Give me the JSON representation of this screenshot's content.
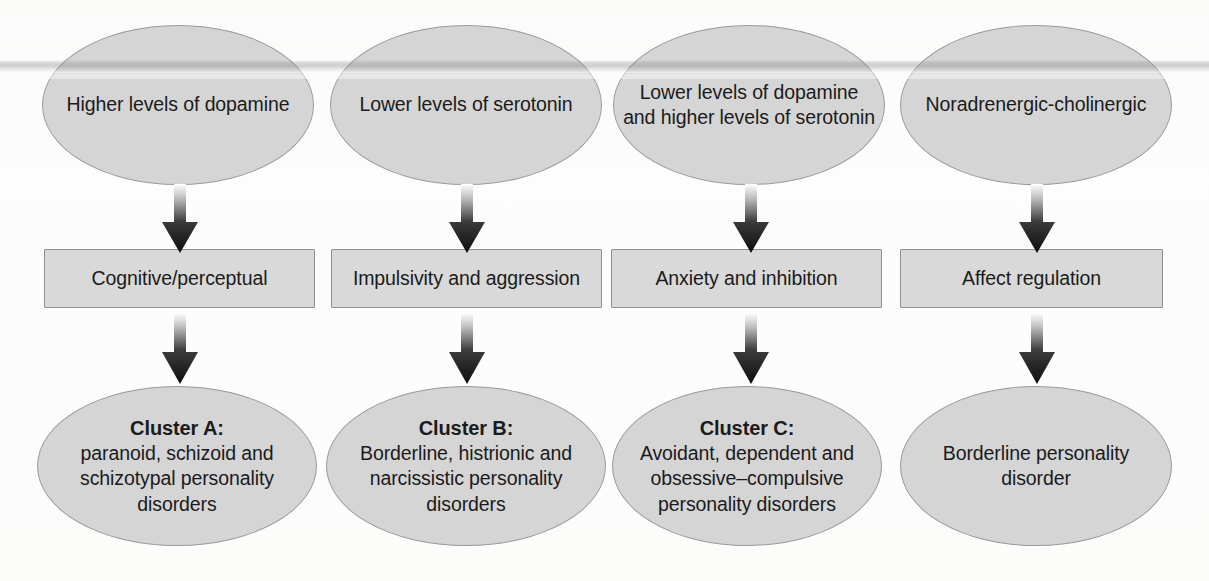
{
  "diagram": {
    "background_color": "#fdfdfd",
    "shape_fill_color": "#d5d5d5",
    "shape_border_color": "#9a9a9a",
    "text_color": "#1b1b1b",
    "arrow_gradient": [
      "#ffffff",
      "#111111"
    ],
    "columns": [
      {
        "id": "column-a",
        "top": {
          "shape": "ellipse",
          "lines": [
            "Higher levels of",
            "dopamine"
          ],
          "text": "Higher levels of dopamine"
        },
        "middle": {
          "shape": "rectangle",
          "text": "Cognitive/perceptual"
        },
        "bottom": {
          "shape": "ellipse",
          "title": "Cluster A:",
          "lines": [
            "paranoid, schizoid",
            "and schizotypal",
            "personality disorders"
          ],
          "text": "paranoid, schizoid and schizotypal personality disorders"
        }
      },
      {
        "id": "column-b",
        "top": {
          "shape": "ellipse",
          "lines": [
            "Lower levels of",
            "serotonin"
          ],
          "text": "Lower levels of serotonin"
        },
        "middle": {
          "shape": "rectangle",
          "text": "Impulsivity and aggression"
        },
        "bottom": {
          "shape": "ellipse",
          "title": "Cluster B:",
          "lines": [
            "Borderline, histrionic",
            "and narcissistic",
            "personality disorders"
          ],
          "text": "Borderline, histrionic and narcissistic personality disorders"
        }
      },
      {
        "id": "column-c",
        "top": {
          "shape": "ellipse",
          "lines": [
            "Lower levels of",
            "dopamine and higher",
            "levels of serotonin"
          ],
          "text": "Lower levels of dopamine and higher levels of serotonin"
        },
        "middle": {
          "shape": "rectangle",
          "text": "Anxiety and inhibition"
        },
        "bottom": {
          "shape": "ellipse",
          "title": "Cluster C:",
          "lines": [
            "Avoidant, dependent",
            "and obsessive–compulsive",
            "personality disorders"
          ],
          "text": "Avoidant, dependent and obsessive–compulsive personality disorders"
        }
      },
      {
        "id": "column-d",
        "top": {
          "shape": "ellipse",
          "lines": [
            "Noradrenergic-",
            "cholinergic"
          ],
          "text": "Noradrenergic-cholinergic"
        },
        "middle": {
          "shape": "rectangle",
          "text": "Affect regulation"
        },
        "bottom": {
          "shape": "ellipse",
          "title": "",
          "lines": [
            "Borderline",
            "personality",
            "disorder"
          ],
          "text": "Borderline personality disorder"
        }
      }
    ],
    "arrows": {
      "direction": "down",
      "count": 8,
      "style": "block-arrow-gradient"
    }
  }
}
